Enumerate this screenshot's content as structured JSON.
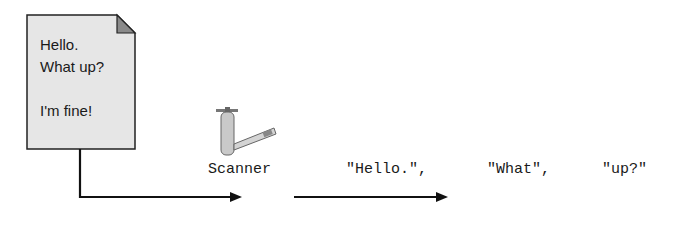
{
  "document": {
    "lines": [
      "Hello.",
      "What up?",
      "",
      "I'm fine!"
    ],
    "fill_color": "#e6e6e6",
    "fold_color": "#8a8a8a"
  },
  "scanner": {
    "label": "Scanner",
    "icon": "faucet-icon"
  },
  "tokens": [
    "\"Hello.\",",
    "\"What\",",
    "\"up?\""
  ],
  "colors": {
    "line": "#111111"
  }
}
